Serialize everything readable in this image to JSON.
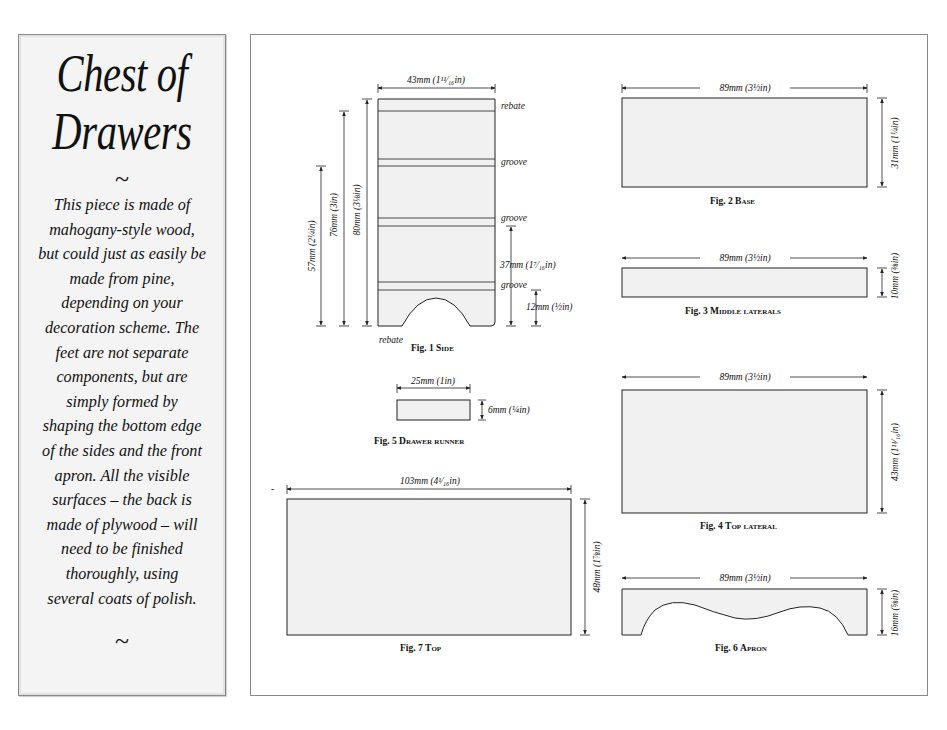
{
  "sidebar": {
    "title_line1": "Chest of",
    "title_line2": "Drawers",
    "divider_top": "~",
    "description": "This piece is made of mahogany-style wood, but could just as easily be made from pine, depending on your decoration scheme. The feet are not separate components, but are simply formed by shaping the bottom edge of the sides and the front apron. All the visible surfaces – the back is made of plywood – will need to be finished thoroughly, using several coats of polish.",
    "description_lines": [
      "This piece is made of",
      "mahogany-style wood,",
      "but could just as easily be",
      "made from pine,",
      "depending on your",
      "decoration scheme. The",
      "feet are not separate",
      "components, but are",
      "simply formed by",
      "shaping the bottom edge",
      "of the sides and the front",
      "apron. All the visible",
      "surfaces – the back is",
      "made of plywood – will",
      "need to be finished",
      "thoroughly, using",
      "several coats of polish."
    ],
    "divider_bottom": "~"
  },
  "figures": {
    "fig1": {
      "caption_prefix": "Fig. 1 ",
      "caption_name": "Side",
      "width_label": "43mm (1¹¹⁄₁₆in)",
      "height_labels": [
        "57mm (2¼in)",
        "76mm (3in)",
        "80mm (3⅛in)"
      ],
      "right_labels": [
        "rebate",
        "groove",
        "groove",
        "groove"
      ],
      "bottom_left_label": "rebate",
      "dim_37": "37mm (1⁷⁄₁₆in)",
      "dim_12": "12mm (½in)"
    },
    "fig2": {
      "caption_prefix": "Fig. 2 ",
      "caption_name": "Base",
      "width_label": "89mm (3½in)",
      "height_label": "31mm (1¼in)"
    },
    "fig3": {
      "caption_prefix": "Fig. 3 ",
      "caption_name": "Middle laterals",
      "width_label": "89mm (3½in)",
      "height_label": "10mm (⅜in)"
    },
    "fig4": {
      "caption_prefix": "Fig. 4 ",
      "caption_name": "Top lateral",
      "width_label": "89mm (3½in)",
      "height_label": "43mm (1¹¹⁄₁₆in)"
    },
    "fig5": {
      "caption_prefix": "Fig. 5 ",
      "caption_name": "Drawer runner",
      "width_label": "25mm (1in)",
      "height_label": "6mm (¼in)"
    },
    "fig6": {
      "caption_prefix": "Fig. 6 ",
      "caption_name": "Apron",
      "width_label": "89mm (3½in)",
      "height_label": "16mm (⅝in)"
    },
    "fig7": {
      "caption_prefix": "Fig. 7 ",
      "caption_name": "Top",
      "width_label": "103mm (4¹⁄₁₆in)",
      "height_label": "48mm (1⅞in)",
      "side_mark": "-"
    }
  }
}
